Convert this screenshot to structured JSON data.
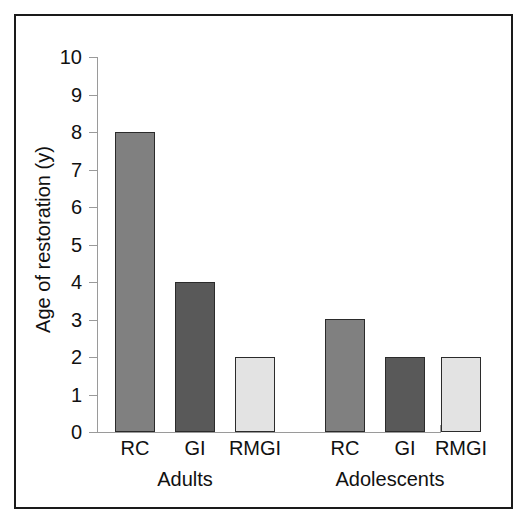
{
  "chart_data": {
    "type": "bar",
    "title": "",
    "xlabel": "",
    "ylabel": "Age of restoration (y)",
    "ylim": [
      0,
      10
    ],
    "ytick_labels": [
      "10",
      "9",
      "8",
      "7",
      "6",
      "5",
      "4",
      "3",
      "2",
      "1",
      "0"
    ],
    "ytick_values": [
      10,
      9,
      8,
      7,
      6,
      5,
      4,
      3,
      2,
      1,
      0
    ],
    "grid": false,
    "legend": "none",
    "groups": [
      "Adults",
      "Adolescents"
    ],
    "categories": [
      "RC",
      "GI",
      "RMGI"
    ],
    "series": [
      {
        "name": "Adults",
        "values": [
          8,
          4,
          2
        ]
      },
      {
        "name": "Adolescents",
        "values": [
          3,
          2,
          2
        ]
      }
    ],
    "bars": [
      {
        "group": "Adults",
        "category": "RC",
        "value": 8,
        "color": "#808080"
      },
      {
        "group": "Adults",
        "category": "GI",
        "value": 4,
        "color": "#595959"
      },
      {
        "group": "Adults",
        "category": "RMGI",
        "value": 2,
        "color": "#e3e3e3"
      },
      {
        "group": "Adolescents",
        "category": "RC",
        "value": 3,
        "color": "#808080"
      },
      {
        "group": "Adolescents",
        "category": "GI",
        "value": 2,
        "color": "#595959"
      },
      {
        "group": "Adolescents",
        "category": "RMGI",
        "value": 2,
        "color": "#e3e3e3"
      }
    ],
    "colors": {
      "RC": "#808080",
      "GI": "#595959",
      "RMGI": "#e3e3e3",
      "bar_border": "#2b2b2b",
      "axis": "#9a9a9a",
      "text": "#111111",
      "frame": "#1a1a1a",
      "background": "#ffffff"
    }
  },
  "axis": {
    "y_title": "Age of restoration (y)",
    "ticks": [
      {
        "label": "10",
        "top": 47
      },
      {
        "label": "9",
        "top": 85
      },
      {
        "label": "8",
        "top": 122
      },
      {
        "label": "7",
        "top": 160
      },
      {
        "label": "6",
        "top": 197
      },
      {
        "label": "5",
        "top": 235
      },
      {
        "label": "4",
        "top": 272
      },
      {
        "label": "3",
        "top": 310
      },
      {
        "label": "2",
        "top": 347
      },
      {
        "label": "1",
        "top": 385
      },
      {
        "label": "0",
        "top": 422
      }
    ]
  },
  "category_labels": [
    {
      "text": "RC",
      "left": 100
    },
    {
      "text": "GI",
      "left": 160
    },
    {
      "text": "RMGI",
      "left": 220
    },
    {
      "text": "RC",
      "left": 310
    },
    {
      "text": "GI",
      "left": 370
    },
    {
      "text": "RMGI",
      "left": 426
    }
  ],
  "group_labels": [
    {
      "text": "Adults",
      "left": 85
    },
    {
      "text": "Adolescents",
      "left": 290
    }
  ],
  "bar_boxes": [
    {
      "name": "bar-adults-rc",
      "left": 115,
      "top": 132,
      "height": 300,
      "color": "#808080"
    },
    {
      "name": "bar-adults-gi",
      "left": 175,
      "top": 282,
      "height": 150,
      "color": "#595959"
    },
    {
      "name": "bar-adults-rmgi",
      "left": 235,
      "top": 357,
      "height": 75,
      "color": "#e3e3e3"
    },
    {
      "name": "bar-adolescents-rc",
      "left": 325,
      "top": 319,
      "height": 113,
      "color": "#808080"
    },
    {
      "name": "bar-adolescents-gi",
      "left": 385,
      "top": 357,
      "height": 75,
      "color": "#595959"
    },
    {
      "name": "bar-adolescents-rmgi",
      "left": 441,
      "top": 357,
      "height": 75,
      "color": "#e3e3e3"
    }
  ]
}
